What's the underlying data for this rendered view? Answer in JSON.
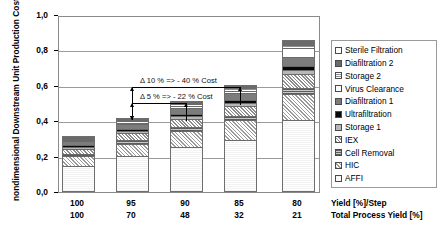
{
  "chart_data": {
    "type": "bar",
    "title": "",
    "subtitle": "",
    "stacked": true,
    "ylabel": "nondimensional Downstream Unit Production Cost [-]",
    "xlabel": "",
    "ylim": [
      0.0,
      1.0
    ],
    "yticks": [
      "0,0",
      "0,2",
      "0,4",
      "0,6",
      "0,8",
      "1,0"
    ],
    "ytick_values": [
      0.0,
      0.2,
      0.4,
      0.6,
      0.8,
      1.0
    ],
    "grid": "horizontal",
    "legend_position": "right",
    "categories": [
      "100",
      "95",
      "90",
      "85",
      "80"
    ],
    "x_axis_rows": [
      {
        "label": "Yield [%]/Step",
        "values": [
          "100",
          "95",
          "90",
          "85",
          "80"
        ]
      },
      {
        "label": "Total Process Yield [%]",
        "values": [
          "100",
          "70",
          "48",
          "32",
          "21"
        ]
      }
    ],
    "series": [
      {
        "name": "AFFI",
        "pattern": "p-affi",
        "values": [
          0.145,
          0.2,
          0.25,
          0.29,
          0.4
        ]
      },
      {
        "name": "HIC",
        "pattern": "p-hic",
        "values": [
          0.055,
          0.07,
          0.09,
          0.11,
          0.15
        ]
      },
      {
        "name": "Cell Removal",
        "pattern": "p-cell",
        "values": [
          0.015,
          0.02,
          0.023,
          0.027,
          0.035
        ]
      },
      {
        "name": "IEX",
        "pattern": "p-iex",
        "values": [
          0.03,
          0.04,
          0.048,
          0.057,
          0.08
        ]
      },
      {
        "name": "Storage 1",
        "pattern": "p-stor1",
        "values": [
          0.012,
          0.014,
          0.016,
          0.018,
          0.022
        ]
      },
      {
        "name": "Ultrafiltration",
        "pattern": "p-ultra",
        "values": [
          0.009,
          0.011,
          0.013,
          0.015,
          0.02
        ]
      },
      {
        "name": "Diafiltration 1",
        "pattern": "p-dia1",
        "values": [
          0.022,
          0.028,
          0.034,
          0.04,
          0.055
        ]
      },
      {
        "name": "Virus Clearance",
        "pattern": "p-virus",
        "values": [
          0.008,
          0.01,
          0.012,
          0.015,
          0.05
        ]
      },
      {
        "name": "Storage 2",
        "pattern": "p-stor2",
        "values": [
          0.008,
          0.01,
          0.012,
          0.014,
          0.02
        ]
      },
      {
        "name": "Diafiltration 2",
        "pattern": "p-dia2",
        "values": [
          0.008,
          0.01,
          0.012,
          0.014,
          0.02
        ]
      },
      {
        "name": "Sterile Filtration",
        "pattern": "p-sterile",
        "values": [
          0.003,
          0.004,
          0.005,
          0.006,
          0.008
        ]
      }
    ],
    "totals": [
      0.315,
      0.417,
      0.515,
      0.606,
      0.86
    ],
    "annotations": [
      {
        "id": "delta10",
        "text": "Δ 10 % => - 40 % Cost",
        "from_category": "95",
        "to_category": "85"
      },
      {
        "id": "delta5",
        "text": "Δ 5 % => - 22 % Cost",
        "from_category": "95",
        "to_category": "90"
      }
    ]
  },
  "legend": {
    "items": [
      {
        "label": "Sterile Filtration",
        "pattern": "p-sterile"
      },
      {
        "label": "Diafiltration 2",
        "pattern": "p-dia2"
      },
      {
        "label": "Storage 2",
        "pattern": "p-stor2"
      },
      {
        "label": "Virus Clearance",
        "pattern": "p-virus"
      },
      {
        "label": "Diafiltration 1",
        "pattern": "p-dia1"
      },
      {
        "label": "Ultrafiltration",
        "pattern": "p-ultra"
      },
      {
        "label": "Storage 1",
        "pattern": "p-stor1"
      },
      {
        "label": "IEX",
        "pattern": "p-iex"
      },
      {
        "label": "Cell Removal",
        "pattern": "p-cell"
      },
      {
        "label": "HIC",
        "pattern": "p-hic"
      },
      {
        "label": "AFFI",
        "pattern": "p-affi"
      }
    ]
  }
}
